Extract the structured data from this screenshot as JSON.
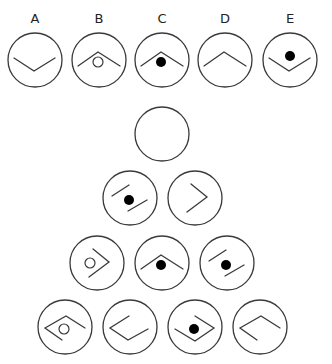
{
  "diagram": {
    "type": "figure-series-puzzle",
    "colors": {
      "line": "#3a3a3a",
      "filled_dot": "#000000",
      "background": "#ffffff"
    }
  },
  "options": [
    {
      "label": "A",
      "cx": 35,
      "cy": 60,
      "shape": "chevron-down",
      "dot": "none"
    },
    {
      "label": "B",
      "cx": 99,
      "cy": 60,
      "shape": "chevron-up",
      "dot": "hollow"
    },
    {
      "label": "C",
      "cx": 162,
      "cy": 60,
      "shape": "chevron-up",
      "dot": "filled"
    },
    {
      "label": "D",
      "cx": 225,
      "cy": 60,
      "shape": "chevron-up",
      "dot": "none"
    },
    {
      "label": "E",
      "cx": 290,
      "cy": 60,
      "shape": "chevron-down",
      "dot": "filled"
    }
  ],
  "pyramid": {
    "rows": [
      [
        {
          "cx": 162,
          "cy": 134,
          "shape": "blank",
          "dot": "none"
        }
      ],
      [
        {
          "cx": 130,
          "cy": 198,
          "shape": "parallel-lines",
          "dot": "filled"
        },
        {
          "cx": 195,
          "cy": 198,
          "shape": "chevron-right",
          "dot": "none"
        }
      ],
      [
        {
          "cx": 97,
          "cy": 263,
          "shape": "chevron-right",
          "dot": "hollow"
        },
        {
          "cx": 162,
          "cy": 263,
          "shape": "chevron-up",
          "dot": "filled"
        },
        {
          "cx": 227,
          "cy": 263,
          "shape": "parallel-lines",
          "dot": "filled"
        }
      ],
      [
        {
          "cx": 65,
          "cy": 327,
          "shape": "diamond-open-br",
          "dot": "hollow"
        },
        {
          "cx": 130,
          "cy": 327,
          "shape": "diamond-open-tr",
          "dot": "none"
        },
        {
          "cx": 195,
          "cy": 327,
          "shape": "diamond-open-tl",
          "dot": "filled"
        },
        {
          "cx": 260,
          "cy": 327,
          "shape": "diamond-open-br",
          "dot": "none"
        }
      ]
    ]
  },
  "radius": 27
}
